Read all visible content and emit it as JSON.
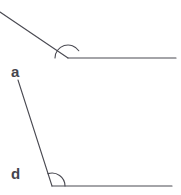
{
  "figure": {
    "background_color": "#ffffff",
    "stroke_color": "#4a4a52",
    "label_color": "#45454d",
    "stroke_width": 1.1,
    "width": 181,
    "height": 195
  },
  "labels": {
    "angle_a": "a",
    "angle_d": "d"
  },
  "top_figure": {
    "name": "obtuse-angle-figure",
    "vertex": {
      "x": 68,
      "y": 58
    },
    "rays": [
      {
        "name": "descending-diagonal-ray",
        "from": {
          "x": 0,
          "y": 12
        },
        "to": {
          "x": 68,
          "y": 58
        }
      },
      {
        "name": "horizontal-ray-right",
        "from": {
          "x": 68,
          "y": 58
        },
        "to": {
          "x": 176,
          "y": 58
        }
      }
    ],
    "arc": {
      "name": "angle-arc-top",
      "radius": 13,
      "start_angle_deg": 180,
      "end_angle_deg": 326
    }
  },
  "bottom_figure": {
    "name": "labeled-angle-figure",
    "vertex": {
      "x": 52,
      "y": 186
    },
    "rays": [
      {
        "name": "slanted-ray-a",
        "from": {
          "x": 18,
          "y": 80
        },
        "to": {
          "x": 52,
          "y": 186
        }
      },
      {
        "name": "horizontal-ray-d",
        "from": {
          "x": 52,
          "y": 186
        },
        "to": {
          "x": 172,
          "y": 186
        }
      }
    ],
    "arc": {
      "name": "angle-arc-bottom",
      "radius": 13,
      "start_angle_deg": 180,
      "end_angle_deg": 288
    }
  }
}
